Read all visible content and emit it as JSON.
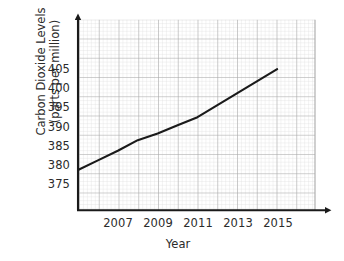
{
  "chart_data": {
    "type": "line",
    "title": "",
    "xlabel": "Year",
    "ylabel": "Carbon Dioxide Levels (parts per million)",
    "ylabel_line1": "Carbon Dioxide Levels",
    "ylabel_line2": "(parts per million)",
    "x": [
      2005,
      2006,
      2007,
      2008,
      2009,
      2010,
      2011,
      2012,
      2013,
      2014,
      2015
    ],
    "values": [
      379.0,
      381.0,
      383.0,
      385.2,
      386.6,
      388.3,
      390.0,
      392.5,
      395.0,
      397.5,
      400.0
    ],
    "xlim": [
      2005,
      2016.9
    ],
    "ylim": [
      370.6,
      410.3
    ],
    "xticks": [
      2007,
      2009,
      2011,
      2013,
      2015
    ],
    "xtick_labels": [
      "2007",
      "2009",
      "2011",
      "2013",
      "2015"
    ],
    "yticks": [
      375,
      380,
      385,
      390,
      395,
      400,
      405
    ],
    "ytick_labels": [
      "375",
      "380",
      "385",
      "390",
      "395",
      "400",
      "405"
    ],
    "grid": true,
    "minor_grid": true,
    "legend": false,
    "line_color": "#1a1a1a",
    "major_grid_color": "#a9a9a9",
    "minor_grid_color": "#d8d8d8",
    "axis_color": "#1a1a1a",
    "background": "#ffffff",
    "series": [
      {
        "name": "Carbon Dioxide Levels",
        "values": [
          379.0,
          381.0,
          383.0,
          385.2,
          386.6,
          388.3,
          390.0,
          392.5,
          395.0,
          397.5,
          400.0
        ]
      }
    ]
  },
  "axes": {
    "y_title_line1": "Carbon Dioxide Levels",
    "y_title_line2": "(parts per million)",
    "x_title": "Year",
    "y_ticks": [
      "405",
      "400",
      "395",
      "390",
      "385",
      "380",
      "375"
    ],
    "x_ticks": [
      "2007",
      "2009",
      "2011",
      "2013",
      "2015"
    ]
  }
}
